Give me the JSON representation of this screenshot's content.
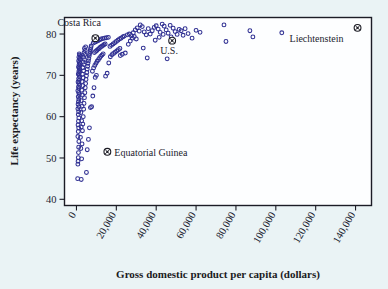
{
  "chart_data": {
    "type": "scatter",
    "title": "",
    "xlabel": "Gross domestic product per capita (dollars)",
    "ylabel": "Life expectancy (years)",
    "xlim": [
      -6000,
      148000
    ],
    "ylim": [
      38.5,
      84
    ],
    "grid": false,
    "legend": null,
    "xticks": [
      0,
      20000,
      40000,
      60000,
      80000,
      100000,
      120000,
      140000
    ],
    "xtick_labels": [
      "0",
      "20,000",
      "40,000",
      "60,000",
      "80,000",
      "100,000",
      "120,000",
      "140,000"
    ],
    "yticks": [
      40,
      50,
      60,
      70,
      80
    ],
    "ytick_labels": [
      "40",
      "50",
      "60",
      "70",
      "80"
    ],
    "marker_color": "#2f2f92",
    "background_color": "#eaf3f5",
    "plot_background_color": "#fdfeff",
    "annotations": [
      {
        "label": "Costa Rica",
        "x": 9500,
        "y": 79.0,
        "label_dx": -38,
        "label_dy": -12,
        "anchor": "start"
      },
      {
        "label": "U.S.",
        "x": 48000,
        "y": 78.4,
        "label_dx": -12,
        "label_dy": 13,
        "anchor": "start"
      },
      {
        "label": "Equatorial Guinea",
        "x": 15500,
        "y": 51.5,
        "label_dx": 7,
        "label_dy": 4,
        "anchor": "start"
      },
      {
        "label": "Liechtenstein",
        "x": 141000,
        "y": 81.5,
        "label_dx": -68,
        "label_dy": 14,
        "anchor": "start"
      }
    ],
    "points": [
      [
        600,
        45.0
      ],
      [
        700,
        48.5
      ],
      [
        800,
        49.2
      ],
      [
        900,
        50.1
      ],
      [
        1000,
        51.3
      ],
      [
        1100,
        52.6
      ],
      [
        1200,
        54.0
      ],
      [
        700,
        55.2
      ],
      [
        900,
        56.4
      ],
      [
        1100,
        57.3
      ],
      [
        800,
        58.0
      ],
      [
        1000,
        58.9
      ],
      [
        1200,
        59.7
      ],
      [
        900,
        60.5
      ],
      [
        1100,
        61.2
      ],
      [
        700,
        61.9
      ],
      [
        1300,
        62.4
      ],
      [
        800,
        63.0
      ],
      [
        1000,
        63.6
      ],
      [
        1200,
        64.2
      ],
      [
        900,
        64.8
      ],
      [
        1400,
        65.3
      ],
      [
        1100,
        65.8
      ],
      [
        700,
        66.3
      ],
      [
        1300,
        66.8
      ],
      [
        1000,
        67.2
      ],
      [
        1500,
        67.6
      ],
      [
        1200,
        68.0
      ],
      [
        800,
        68.4
      ],
      [
        1400,
        68.8
      ],
      [
        1100,
        69.2
      ],
      [
        1600,
        69.6
      ],
      [
        1300,
        70.0
      ],
      [
        900,
        70.3
      ],
      [
        1500,
        70.7
      ],
      [
        1200,
        71.0
      ],
      [
        1700,
        71.3
      ],
      [
        1400,
        71.7
      ],
      [
        1000,
        72.0
      ],
      [
        1600,
        72.3
      ],
      [
        1300,
        72.6
      ],
      [
        1800,
        72.9
      ],
      [
        1500,
        73.2
      ],
      [
        1100,
        73.5
      ],
      [
        1900,
        73.8
      ],
      [
        1600,
        74.1
      ],
      [
        1200,
        74.4
      ],
      [
        2000,
        74.6
      ],
      [
        1700,
        74.9
      ],
      [
        1400,
        75.2
      ],
      [
        2400,
        44.8
      ],
      [
        2600,
        49.8
      ],
      [
        2200,
        52.3
      ],
      [
        2800,
        53.4
      ],
      [
        2000,
        55.0
      ],
      [
        3000,
        56.6
      ],
      [
        2400,
        57.5
      ],
      [
        3200,
        58.2
      ],
      [
        2600,
        59.0
      ],
      [
        3400,
        60.0
      ],
      [
        2200,
        61.0
      ],
      [
        3600,
        61.8
      ],
      [
        2800,
        62.5
      ],
      [
        3800,
        63.2
      ],
      [
        2400,
        63.9
      ],
      [
        4000,
        64.6
      ],
      [
        3000,
        65.2
      ],
      [
        4200,
        65.8
      ],
      [
        2600,
        66.4
      ],
      [
        4400,
        67.0
      ],
      [
        3200,
        67.5
      ],
      [
        4600,
        68.0
      ],
      [
        2800,
        68.5
      ],
      [
        4800,
        69.0
      ],
      [
        3400,
        69.4
      ],
      [
        5000,
        69.9
      ],
      [
        3000,
        70.3
      ],
      [
        5200,
        70.7
      ],
      [
        3600,
        71.1
      ],
      [
        5400,
        71.5
      ],
      [
        3200,
        71.9
      ],
      [
        5600,
        72.2
      ],
      [
        3800,
        72.6
      ],
      [
        5800,
        72.9
      ],
      [
        3400,
        73.2
      ],
      [
        6000,
        73.5
      ],
      [
        4000,
        73.8
      ],
      [
        6200,
        74.1
      ],
      [
        3600,
        74.4
      ],
      [
        6400,
        74.7
      ],
      [
        4200,
        75.0
      ],
      [
        6600,
        75.2
      ],
      [
        3800,
        75.5
      ],
      [
        6800,
        75.7
      ],
      [
        4400,
        76.0
      ],
      [
        7000,
        76.2
      ],
      [
        4000,
        76.5
      ],
      [
        7200,
        76.7
      ],
      [
        4600,
        76.9
      ],
      [
        7400,
        77.1
      ],
      [
        5000,
        46.5
      ],
      [
        5400,
        52.0
      ],
      [
        6000,
        54.5
      ],
      [
        6500,
        57.3
      ],
      [
        7000,
        62.2
      ],
      [
        7600,
        62.4
      ],
      [
        8200,
        65.0
      ],
      [
        8800,
        67.0
      ],
      [
        9400,
        69.5
      ],
      [
        10000,
        70.0
      ],
      [
        8000,
        71.0
      ],
      [
        8600,
        71.8
      ],
      [
        9200,
        72.4
      ],
      [
        9800,
        72.9
      ],
      [
        10400,
        73.4
      ],
      [
        11000,
        73.8
      ],
      [
        11600,
        74.2
      ],
      [
        12200,
        74.6
      ],
      [
        12800,
        74.9
      ],
      [
        13400,
        75.2
      ],
      [
        9000,
        75.5
      ],
      [
        9600,
        75.8
      ],
      [
        10200,
        76.0
      ],
      [
        10800,
        76.3
      ],
      [
        11400,
        76.5
      ],
      [
        12000,
        76.8
      ],
      [
        12600,
        77.0
      ],
      [
        13200,
        77.2
      ],
      [
        13800,
        77.4
      ],
      [
        14400,
        77.6
      ],
      [
        8400,
        77.8
      ],
      [
        9200,
        78.0
      ],
      [
        10000,
        78.2
      ],
      [
        10800,
        78.4
      ],
      [
        11600,
        78.6
      ],
      [
        12400,
        78.8
      ],
      [
        13200,
        78.9
      ],
      [
        14000,
        79.0
      ],
      [
        15000,
        79.1
      ],
      [
        16000,
        79.2
      ],
      [
        14600,
        69.8
      ],
      [
        15400,
        70.5
      ],
      [
        16200,
        73.0
      ],
      [
        17000,
        74.5
      ],
      [
        17800,
        75.0
      ],
      [
        18600,
        75.3
      ],
      [
        19400,
        75.6
      ],
      [
        20200,
        75.9
      ],
      [
        21000,
        76.2
      ],
      [
        21800,
        76.5
      ],
      [
        16800,
        77.0
      ],
      [
        17600,
        77.3
      ],
      [
        18400,
        77.6
      ],
      [
        19200,
        77.9
      ],
      [
        20000,
        78.2
      ],
      [
        20800,
        78.5
      ],
      [
        21600,
        78.8
      ],
      [
        22400,
        79.0
      ],
      [
        23200,
        79.3
      ],
      [
        24000,
        79.5
      ],
      [
        22000,
        74.8
      ],
      [
        23000,
        75.1
      ],
      [
        24500,
        75.4
      ],
      [
        25500,
        79.8
      ],
      [
        26500,
        80.0
      ],
      [
        27500,
        79.6
      ],
      [
        28500,
        80.3
      ],
      [
        29500,
        81.0
      ],
      [
        30500,
        81.5
      ],
      [
        31500,
        80.7
      ],
      [
        26000,
        77.5
      ],
      [
        27000,
        78.3
      ],
      [
        28000,
        79.0
      ],
      [
        29000,
        79.4
      ],
      [
        30000,
        78.8
      ],
      [
        32000,
        82.2
      ],
      [
        33000,
        81.8
      ],
      [
        34000,
        80.5
      ],
      [
        35000,
        79.8
      ],
      [
        36000,
        81.3
      ],
      [
        33500,
        76.6
      ],
      [
        35500,
        74.2
      ],
      [
        37000,
        80.0
      ],
      [
        38000,
        80.8
      ],
      [
        39000,
        81.6
      ],
      [
        40000,
        82.0
      ],
      [
        41000,
        81.2
      ],
      [
        42000,
        80.4
      ],
      [
        43000,
        82.4
      ],
      [
        44000,
        81.9
      ],
      [
        39500,
        78.5
      ],
      [
        41500,
        79.2
      ],
      [
        43500,
        79.9
      ],
      [
        45000,
        81.0
      ],
      [
        46000,
        80.2
      ],
      [
        47000,
        82.1
      ],
      [
        48500,
        81.4
      ],
      [
        49500,
        80.6
      ],
      [
        50500,
        79.9
      ],
      [
        51500,
        81.1
      ],
      [
        45500,
        74.0
      ],
      [
        47500,
        79.3
      ],
      [
        52500,
        80.8
      ],
      [
        53500,
        79.7
      ],
      [
        54500,
        81.3
      ],
      [
        56000,
        80.1
      ],
      [
        58000,
        79.0
      ],
      [
        60000,
        80.9
      ],
      [
        62000,
        80.4
      ],
      [
        74000,
        82.2
      ],
      [
        75000,
        78.2
      ],
      [
        87000,
        80.8
      ],
      [
        88500,
        79.3
      ],
      [
        103000,
        80.3
      ]
    ]
  }
}
